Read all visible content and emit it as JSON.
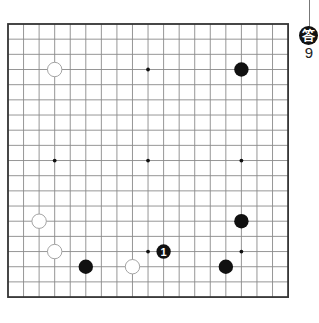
{
  "problem": {
    "answer_label": "答",
    "answer_number": "9"
  },
  "board": {
    "size": 19,
    "origin_x": 8,
    "origin_y": 24,
    "spacing_x": 15.56,
    "spacing_y": 15.17,
    "line_color": "#8a8a8a",
    "border_color": "#333333",
    "background": "#ffffff",
    "star_points": [
      [
        3,
        3
      ],
      [
        9,
        3
      ],
      [
        15,
        3
      ],
      [
        3,
        9
      ],
      [
        9,
        9
      ],
      [
        15,
        9
      ],
      [
        3,
        15
      ],
      [
        9,
        15
      ],
      [
        15,
        15
      ]
    ],
    "stones": [
      {
        "color": "white",
        "col": 3,
        "row": 3
      },
      {
        "color": "black",
        "col": 15,
        "row": 3
      },
      {
        "color": "white",
        "col": 2,
        "row": 13
      },
      {
        "color": "black",
        "col": 15,
        "row": 13
      },
      {
        "color": "white",
        "col": 3,
        "row": 15
      },
      {
        "color": "black",
        "col": 10,
        "row": 15,
        "label": "1"
      },
      {
        "color": "black",
        "col": 5,
        "row": 16
      },
      {
        "color": "white",
        "col": 8,
        "row": 16
      },
      {
        "color": "black",
        "col": 14,
        "row": 16
      }
    ]
  }
}
